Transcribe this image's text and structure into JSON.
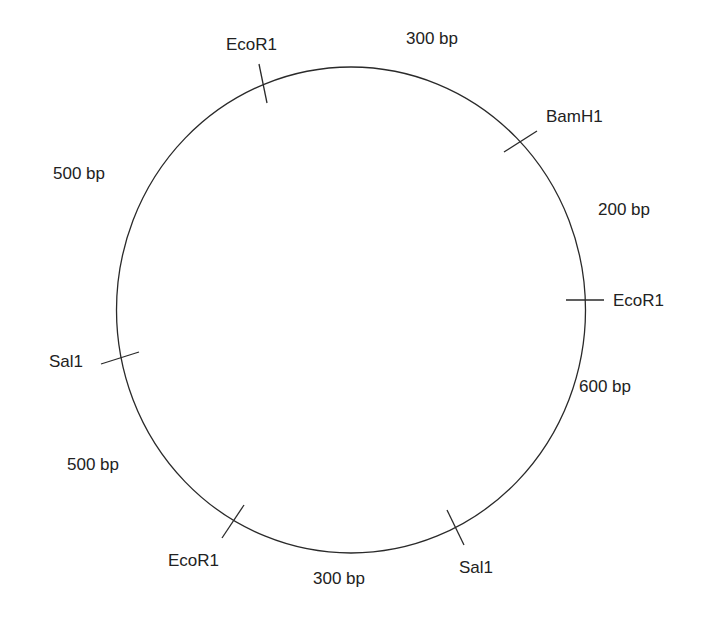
{
  "diagram": {
    "type": "plasmid restriction map",
    "ring": {
      "cx": 351,
      "cy": 310,
      "rx": 235,
      "ry": 243,
      "color": "#2a2a2a"
    },
    "restriction_sites": [
      {
        "enzyme": "EcoR1",
        "position": "top-left"
      },
      {
        "enzyme": "BamH1",
        "position": "top-right"
      },
      {
        "enzyme": "EcoR1",
        "position": "right"
      },
      {
        "enzyme": "Sal1",
        "position": "bottom-right"
      },
      {
        "enzyme": "EcoR1",
        "position": "bottom-left"
      },
      {
        "enzyme": "Sal1",
        "position": "left"
      }
    ],
    "fragments": [
      {
        "size": "300 bp",
        "between": [
          "EcoR1 (top-left)",
          "BamH1"
        ]
      },
      {
        "size": "200 bp",
        "between": [
          "BamH1",
          "EcoR1 (right)"
        ]
      },
      {
        "size": "600 bp",
        "between": [
          "EcoR1 (right)",
          "Sal1 (bottom-right)"
        ]
      },
      {
        "size": "300 bp",
        "between": [
          "Sal1 (bottom-right)",
          "EcoR1 (bottom-left)"
        ]
      },
      {
        "size": "500 bp",
        "between": [
          "EcoR1 (bottom-left)",
          "Sal1 (left)"
        ]
      },
      {
        "size": "500 bp",
        "between": [
          "Sal1 (left)",
          "EcoR1 (top-left)"
        ]
      }
    ]
  },
  "labels": {
    "site_ecor1_top": "EcoR1",
    "site_bamh1": "BamH1",
    "site_ecor1_right": "EcoR1",
    "site_sal1_bottom": "Sal1",
    "site_ecor1_bottom": "EcoR1",
    "site_sal1_left": "Sal1",
    "frag_top": "300 bp",
    "frag_upper_right": "200 bp",
    "frag_lower_right": "600 bp",
    "frag_bottom": "300 bp",
    "frag_lower_left": "500 bp",
    "frag_upper_left": "500 bp"
  }
}
